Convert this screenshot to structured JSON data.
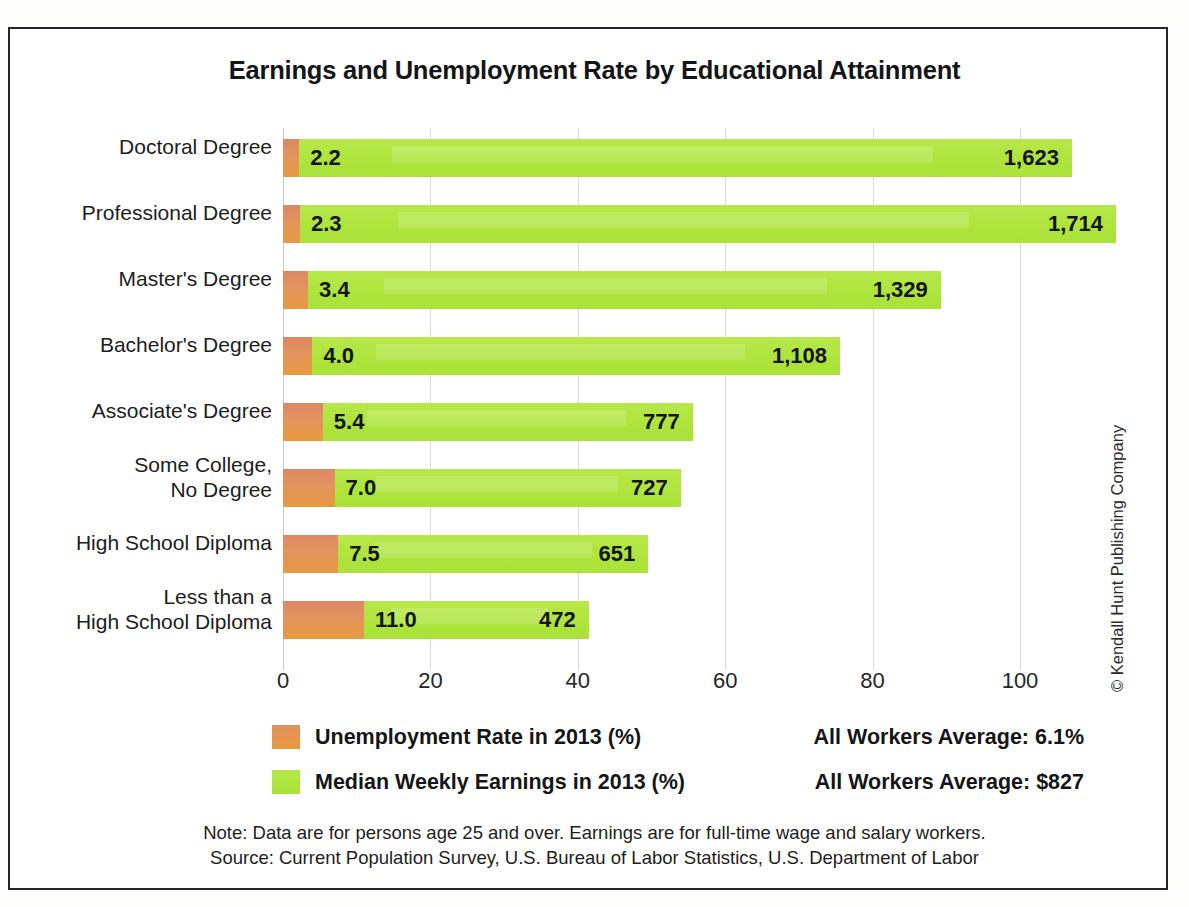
{
  "title": "Earnings and Unemployment Rate by Educational Attainment",
  "credit": "© Kendall Hunt Publishing Company",
  "legend": {
    "unemployment_label": "Unemployment Rate in 2013 (%)",
    "unemployment_average": "All Workers Average: 6.1%",
    "earnings_label": "Median Weekly Earnings in 2013 (%)",
    "earnings_average": "All Workers Average: $827",
    "unemployment_color": "#e2945d",
    "earnings_color": "#aee43c"
  },
  "footnote": {
    "line1": "Note: Data are for persons age 25 and over. Earnings are for full-time wage and salary workers.",
    "line2": "Source: Current Population Survey, U.S. Bureau of Labor Statistics, U.S. Department of Labor"
  },
  "axis": {
    "ticks": [
      "0",
      "20",
      "40",
      "60",
      "80",
      "100"
    ]
  },
  "rows": [
    {
      "label_line1": "Doctoral Degree",
      "label_line2": "",
      "unemployment": "2.2",
      "earnings": "1,623"
    },
    {
      "label_line1": "Professional Degree",
      "label_line2": "",
      "unemployment": "2.3",
      "earnings": "1,714"
    },
    {
      "label_line1": "Master's Degree",
      "label_line2": "",
      "unemployment": "3.4",
      "earnings": "1,329"
    },
    {
      "label_line1": "Bachelor's Degree",
      "label_line2": "",
      "unemployment": "4.0",
      "earnings": "1,108"
    },
    {
      "label_line1": "Associate's Degree",
      "label_line2": "",
      "unemployment": "5.4",
      "earnings": "777"
    },
    {
      "label_line1": "Some College,",
      "label_line2": "No Degree",
      "unemployment": "7.0",
      "earnings": "727"
    },
    {
      "label_line1": "High School Diploma",
      "label_line2": "",
      "unemployment": "7.5",
      "earnings": "651"
    },
    {
      "label_line1": "Less than a",
      "label_line2": "High School Diploma",
      "unemployment": "11.0",
      "earnings": "472"
    }
  ],
  "chart_data": {
    "type": "bar",
    "orientation": "horizontal",
    "stacked": true,
    "title": "Earnings and Unemployment Rate by Educational Attainment",
    "xlabel": "",
    "ylabel": "",
    "xlim": [
      0,
      100
    ],
    "xticks": [
      0,
      20,
      40,
      60,
      80,
      100
    ],
    "grid": true,
    "legend_position": "bottom",
    "categories": [
      "Doctoral Degree",
      "Professional Degree",
      "Master's Degree",
      "Bachelor's Degree",
      "Associate's Degree",
      "Some College, No Degree",
      "High School Diploma",
      "Less than a High School Diploma"
    ],
    "series": [
      {
        "name": "Unemployment Rate in 2013 (%)",
        "color": "#e2945d",
        "units": "percent",
        "values": [
          2.2,
          2.3,
          3.4,
          4.0,
          5.4,
          7.0,
          7.5,
          11.0
        ]
      },
      {
        "name": "Median Weekly Earnings in 2013 (%)",
        "color": "#aee43c",
        "units": "dollars per week",
        "values": [
          1623,
          1714,
          1329,
          1108,
          777,
          727,
          651,
          472
        ]
      }
    ],
    "annotations": [
      "All Workers Average: 6.1%",
      "All Workers Average: $827",
      "Note: Data are for persons age 25 and over. Earnings are for full-time wage and salary workers.",
      "Source: Current Population Survey, U.S. Bureau of Labor Statistics, U.S. Department of Labor"
    ]
  },
  "render": {
    "px_per_unit": 7.37,
    "earnings_units_per_dollar": 0.0646,
    "row_pitch": 66,
    "row_top_offset": 2
  }
}
